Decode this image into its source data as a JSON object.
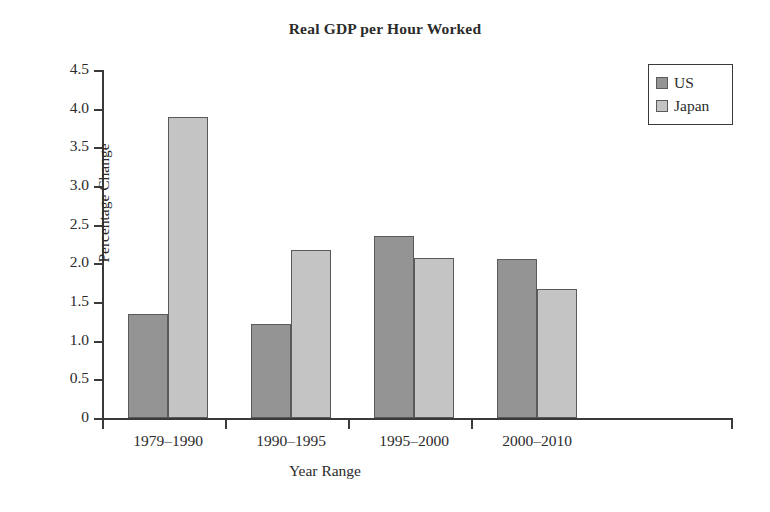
{
  "chart_data": {
    "type": "bar",
    "title": "Real GDP per Hour Worked",
    "xlabel": "Year Range",
    "ylabel": "Percentage Change",
    "categories": [
      "1979–1990",
      "1990–1995",
      "1995–2000",
      "2000–2010"
    ],
    "series": [
      {
        "name": "US",
        "color": "#949494",
        "values": [
          1.35,
          1.22,
          2.36,
          2.05
        ]
      },
      {
        "name": "Japan",
        "color": "#c4c4c4",
        "values": [
          3.89,
          2.17,
          2.07,
          1.67
        ]
      }
    ],
    "ylim": [
      0,
      4.5
    ],
    "ytick_labels": [
      "0",
      "0.5",
      "1.0",
      "1.5",
      "2.0",
      "2.5",
      "3.0",
      "3.5",
      "4.0",
      "4.5"
    ],
    "ytick_values": [
      0,
      0.5,
      1.0,
      1.5,
      2.0,
      2.5,
      3.0,
      3.5,
      4.0,
      4.5
    ],
    "grid": false,
    "legend_position": "top-right",
    "bar_border_color": "#5a5a5a",
    "axis_color": "#3a3a3a"
  },
  "legend": {
    "entries": [
      {
        "label": "US"
      },
      {
        "label": "Japan"
      }
    ]
  }
}
